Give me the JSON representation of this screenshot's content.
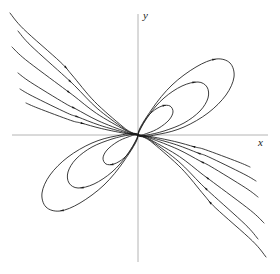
{
  "figure": {
    "type": "phase-portrait",
    "background_color": "#ffffff",
    "curve_color": "#1a1a1a",
    "axis_color": "#b4b4b4",
    "width": 280,
    "height": 274
  },
  "axes": {
    "x_label": "x",
    "y_label": "y",
    "origin": {
      "x": 138,
      "y": 135
    },
    "x_axis": {
      "x1": 12,
      "y1": 135,
      "x2": 268,
      "y2": 135
    },
    "y_axis": {
      "x1": 138,
      "y1": 14,
      "x2": 138,
      "y2": 262
    }
  },
  "chart_data": {
    "type": "line",
    "title": "",
    "xlabel": "x",
    "ylabel": "y",
    "grid": false,
    "legend": null,
    "origin": {
      "x": 0,
      "y": 0
    },
    "petals": {
      "count_per_quadrant": 3,
      "quadrants": [
        1,
        3
      ],
      "tilt_degrees": 45,
      "outer_tip": {
        "x": 230,
        "y": 75
      },
      "middle_tip": {
        "x": 205,
        "y": 92
      },
      "inner_tip": {
        "x": 168,
        "y": 108
      }
    },
    "open_trajectories": {
      "count_per_quadrant": 6,
      "quadrants": [
        2,
        4
      ],
      "direction": "toward origin"
    },
    "arrow_direction": "toward-origin",
    "series": [
      {
        "name": "petal-outer-q1",
        "kind": "closed-orbit",
        "points": [
          [
            0,
            0
          ],
          [
            14,
            26
          ],
          [
            34,
            50
          ],
          [
            58,
            68
          ],
          [
            78,
            76
          ],
          [
            92,
            72
          ],
          [
            96,
            58
          ],
          [
            88,
            40
          ],
          [
            70,
            22
          ],
          [
            46,
            8
          ],
          [
            22,
            1
          ],
          [
            0,
            0
          ]
        ]
      },
      {
        "name": "petal-middle-q1",
        "kind": "closed-orbit",
        "points": [
          [
            0,
            0
          ],
          [
            11,
            20
          ],
          [
            26,
            37
          ],
          [
            44,
            49
          ],
          [
            60,
            53
          ],
          [
            69,
            48
          ],
          [
            70,
            37
          ],
          [
            62,
            24
          ],
          [
            46,
            12
          ],
          [
            26,
            4
          ],
          [
            9,
            0
          ],
          [
            0,
            0
          ]
        ]
      },
      {
        "name": "petal-inner-q1",
        "kind": "closed-orbit",
        "points": [
          [
            0,
            0
          ],
          [
            6,
            13
          ],
          [
            14,
            23
          ],
          [
            24,
            29
          ],
          [
            32,
            29
          ],
          [
            35,
            23
          ],
          [
            31,
            15
          ],
          [
            21,
            7
          ],
          [
            10,
            2
          ],
          [
            0,
            0
          ]
        ]
      },
      {
        "name": "petal-outer-q3",
        "kind": "closed-orbit",
        "points": [
          [
            0,
            0
          ],
          [
            -14,
            -26
          ],
          [
            -34,
            -50
          ],
          [
            -58,
            -68
          ],
          [
            -78,
            -76
          ],
          [
            -92,
            -72
          ],
          [
            -96,
            -58
          ],
          [
            -88,
            -40
          ],
          [
            -70,
            -22
          ],
          [
            -46,
            -8
          ],
          [
            -22,
            -1
          ],
          [
            0,
            0
          ]
        ]
      },
      {
        "name": "petal-middle-q3",
        "kind": "closed-orbit",
        "points": [
          [
            0,
            0
          ],
          [
            -11,
            -20
          ],
          [
            -26,
            -37
          ],
          [
            -44,
            -49
          ],
          [
            -60,
            -53
          ],
          [
            -69,
            -48
          ],
          [
            -70,
            -37
          ],
          [
            -62,
            -24
          ],
          [
            -46,
            -12
          ],
          [
            -26,
            -4
          ],
          [
            -9,
            0
          ],
          [
            0,
            0
          ]
        ]
      },
      {
        "name": "petal-inner-q3",
        "kind": "closed-orbit",
        "points": [
          [
            0,
            0
          ],
          [
            -6,
            -13
          ],
          [
            -14,
            -23
          ],
          [
            -24,
            -29
          ],
          [
            -32,
            -29
          ],
          [
            -35,
            -23
          ],
          [
            -31,
            -15
          ],
          [
            -21,
            -7
          ],
          [
            -10,
            -2
          ],
          [
            0,
            0
          ]
        ]
      },
      {
        "name": "open-q2-1",
        "kind": "open-trajectory",
        "quadrant": 2
      },
      {
        "name": "open-q2-2",
        "kind": "open-trajectory",
        "quadrant": 2
      },
      {
        "name": "open-q2-3",
        "kind": "open-trajectory",
        "quadrant": 2
      },
      {
        "name": "open-q2-4",
        "kind": "open-trajectory",
        "quadrant": 2
      },
      {
        "name": "open-q2-5",
        "kind": "open-trajectory",
        "quadrant": 2
      },
      {
        "name": "open-q2-6",
        "kind": "open-trajectory",
        "quadrant": 2
      },
      {
        "name": "open-q4-1",
        "kind": "open-trajectory",
        "quadrant": 4
      },
      {
        "name": "open-q4-2",
        "kind": "open-trajectory",
        "quadrant": 4
      },
      {
        "name": "open-q4-3",
        "kind": "open-trajectory",
        "quadrant": 4
      },
      {
        "name": "open-q4-4",
        "kind": "open-trajectory",
        "quadrant": 4
      },
      {
        "name": "open-q4-5",
        "kind": "open-trajectory",
        "quadrant": 4
      },
      {
        "name": "open-q4-6",
        "kind": "open-trajectory",
        "quadrant": 4
      }
    ]
  }
}
